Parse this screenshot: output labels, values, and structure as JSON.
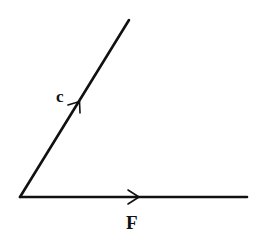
{
  "diagram": {
    "type": "vector-angle",
    "colors": {
      "line": "#111111",
      "background": "#ffffff"
    },
    "origin": [
      20,
      197
    ],
    "vectors": [
      {
        "id": "c",
        "label": "c",
        "end": [
          129,
          20
        ],
        "arrow_at": [
          78,
          103
        ],
        "label_pos": [
          57,
          101
        ]
      },
      {
        "id": "F",
        "label": "F",
        "end": [
          247,
          197
        ],
        "arrow_at": [
          137,
          197
        ],
        "label_pos": [
          126,
          229
        ]
      }
    ]
  }
}
